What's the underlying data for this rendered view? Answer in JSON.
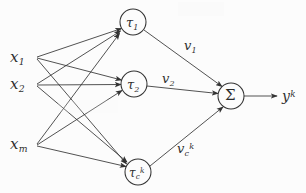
{
  "diagram": {
    "type": "neural-network-graph",
    "background_color": "#fdfdfd",
    "stroke_color": "#1a1a1a",
    "inputs": [
      {
        "id": "x1",
        "label_base": "x",
        "sub": "1",
        "sup": "",
        "x": 22,
        "y": 58
      },
      {
        "id": "x2",
        "label_base": "x",
        "sub": "2",
        "sup": "",
        "x": 22,
        "y": 85
      },
      {
        "id": "xm",
        "label_base": "x",
        "sub": "m",
        "sup": "",
        "x": 22,
        "y": 145
      }
    ],
    "hidden_nodes": [
      {
        "id": "tau1",
        "label_base": "τ",
        "sub": "1",
        "sup": "",
        "cx": 133,
        "cy": 22,
        "r": 13
      },
      {
        "id": "tau2",
        "label_base": "τ",
        "sub": "2",
        "sup": "",
        "cx": 134,
        "cy": 84,
        "r": 13
      },
      {
        "id": "tauck",
        "label_base": "τ",
        "sub": "c",
        "sup": "k",
        "cx": 138,
        "cy": 172,
        "r": 13
      }
    ],
    "output_node": {
      "id": "sigma",
      "label": "Σ",
      "cx": 231,
      "cy": 96,
      "r": 13
    },
    "output_label": {
      "id": "yk",
      "label_base": "y",
      "sub": "",
      "sup": "k",
      "x": 282,
      "y": 92
    },
    "weights": [
      {
        "id": "v1",
        "label_base": "v",
        "sub": "1",
        "sup": "",
        "x": 190,
        "y": 45
      },
      {
        "id": "v2",
        "label_base": "v",
        "sub": "2",
        "sup": "",
        "x": 168,
        "y": 78
      },
      {
        "id": "vck",
        "label_base": "v",
        "sub": "c",
        "sup": "k",
        "x": 183,
        "y": 148
      }
    ],
    "edges_input_to_hidden": [
      {
        "from": "x1",
        "to": "tau1"
      },
      {
        "from": "x1",
        "to": "tau2"
      },
      {
        "from": "x1",
        "to": "tauck"
      },
      {
        "from": "x2",
        "to": "tau1"
      },
      {
        "from": "x2",
        "to": "tau2"
      },
      {
        "from": "x2",
        "to": "tauck"
      },
      {
        "from": "xm",
        "to": "tau1"
      },
      {
        "from": "xm",
        "to": "tau2"
      },
      {
        "from": "xm",
        "to": "tauck"
      }
    ],
    "edges_hidden_to_output": [
      {
        "from": "tau1",
        "to": "sigma",
        "weight": "v1"
      },
      {
        "from": "tau2",
        "to": "sigma",
        "weight": "v2"
      },
      {
        "from": "tauck",
        "to": "sigma",
        "weight": "vck"
      }
    ],
    "edge_output": {
      "from": "sigma",
      "to": "yk"
    }
  }
}
